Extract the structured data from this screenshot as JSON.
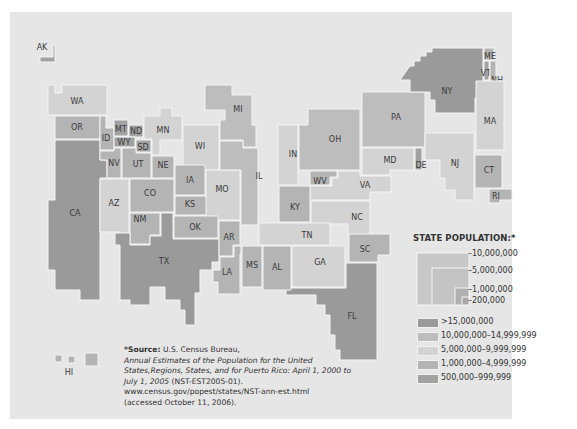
{
  "map": {
    "type": "cartogram",
    "subject": "U.S. state population",
    "states": [
      {
        "abbr": "AK",
        "class": "500,000-999,999"
      },
      {
        "abbr": "WA",
        "class": "5,000,000-9,999,999"
      },
      {
        "abbr": "OR",
        "class": "1,000,000-4,999,999"
      },
      {
        "abbr": "CA",
        "class": ">15,000,000"
      },
      {
        "abbr": "ID",
        "class": "1,000,000-4,999,999"
      },
      {
        "abbr": "MT",
        "class": "500,000-999,999"
      },
      {
        "abbr": "ND",
        "class": "500,000-999,999"
      },
      {
        "abbr": "WY",
        "class": "500,000-999,999"
      },
      {
        "abbr": "SD",
        "class": "500,000-999,999"
      },
      {
        "abbr": "MN",
        "class": "5,000,000-9,999,999"
      },
      {
        "abbr": "NV",
        "class": "1,000,000-4,999,999"
      },
      {
        "abbr": "UT",
        "class": "1,000,000-4,999,999"
      },
      {
        "abbr": "NE",
        "class": "1,000,000-4,999,999"
      },
      {
        "abbr": "WI",
        "class": "5,000,000-9,999,999"
      },
      {
        "abbr": "MI",
        "class": "10,000,000-14,999,999"
      },
      {
        "abbr": "IA",
        "class": "1,000,000-4,999,999"
      },
      {
        "abbr": "CO",
        "class": "1,000,000-4,999,999"
      },
      {
        "abbr": "AZ",
        "class": "5,000,000-9,999,999"
      },
      {
        "abbr": "KS",
        "class": "1,000,000-4,999,999"
      },
      {
        "abbr": "MO",
        "class": "5,000,000-9,999,999"
      },
      {
        "abbr": "IL",
        "class": "10,000,000-14,999,999"
      },
      {
        "abbr": "IN",
        "class": "5,000,000-9,999,999"
      },
      {
        "abbr": "OH",
        "class": "10,000,000-14,999,999"
      },
      {
        "abbr": "PA",
        "class": "10,000,000-14,999,999"
      },
      {
        "abbr": "NY",
        "class": ">15,000,000"
      },
      {
        "abbr": "ME",
        "class": "1,000,000-4,999,999"
      },
      {
        "abbr": "VT",
        "class": "500,000-999,999"
      },
      {
        "abbr": "NH",
        "class": "1,000,000-4,999,999"
      },
      {
        "abbr": "MA",
        "class": "5,000,000-9,999,999"
      },
      {
        "abbr": "CT",
        "class": "1,000,000-4,999,999"
      },
      {
        "abbr": "RI",
        "class": "1,000,000-4,999,999"
      },
      {
        "abbr": "NJ",
        "class": "5,000,000-9,999,999"
      },
      {
        "abbr": "DE",
        "class": "500,000-999,999"
      },
      {
        "abbr": "MD",
        "class": "5,000,000-9,999,999"
      },
      {
        "abbr": "WV",
        "class": "1,000,000-4,999,999"
      },
      {
        "abbr": "VA",
        "class": "5,000,000-9,999,999"
      },
      {
        "abbr": "KY",
        "class": "1,000,000-4,999,999"
      },
      {
        "abbr": "NC",
        "class": "5,000,000-9,999,999"
      },
      {
        "abbr": "TN",
        "class": "5,000,000-9,999,999"
      },
      {
        "abbr": "SC",
        "class": "1,000,000-4,999,999"
      },
      {
        "abbr": "NM",
        "class": "1,000,000-4,999,999"
      },
      {
        "abbr": "OK",
        "class": "1,000,000-4,999,999"
      },
      {
        "abbr": "TX",
        "class": ">15,000,000"
      },
      {
        "abbr": "AR",
        "class": "1,000,000-4,999,999"
      },
      {
        "abbr": "LA",
        "class": "1,000,000-4,999,999"
      },
      {
        "abbr": "MS",
        "class": "1,000,000-4,999,999"
      },
      {
        "abbr": "AL",
        "class": "1,000,000-4,999,999"
      },
      {
        "abbr": "GA",
        "class": "5,000,000-9,999,999"
      },
      {
        "abbr": "FL",
        "class": ">15,000,000"
      },
      {
        "abbr": "HI",
        "class": "1,000,000-4,999,999"
      }
    ]
  },
  "legend": {
    "title": "STATE POPULATION:*",
    "size_ticks": [
      "10,000,000",
      "5,000,000",
      "1,000,000",
      "200,000"
    ],
    "classes": [
      {
        "label": ">15,000,000",
        "color": "#9a9a9a"
      },
      {
        "label": "10,000,000–14,999,999",
        "color": "#bdbdbd"
      },
      {
        "label": "5,000,000–9,999,999",
        "color": "#d3d3d3"
      },
      {
        "label": "1,000,000–4,999,999",
        "color": "#b4b4b4"
      },
      {
        "label": "500,000–999,999",
        "color": "#a2a2a2"
      }
    ]
  },
  "source": {
    "prefix": "*Source:",
    "agency": "U.S. Census Bureau,",
    "title": "Annual Estimates of the Population for the United States,Regions, States, and for Puerto Rico: April 1, 2000 to July 1, 2005",
    "code": "(NST-EST2005-01).",
    "url": "www.census.gov/popest/states/NST-ann-est.html",
    "accessed": "(accessed October 11, 2006)."
  },
  "colors": {
    "background": "#e6e6e6",
    "gt15m": "#9a9a9a",
    "m10to15": "#bdbdbd",
    "m5to10": "#d3d3d3",
    "m1to5": "#b4b4b4",
    "k500to1m": "#a2a2a2"
  }
}
